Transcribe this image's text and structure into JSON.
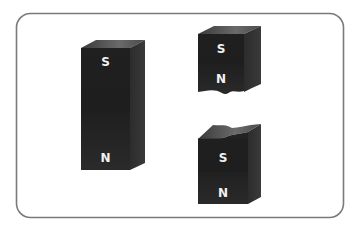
{
  "diagram": {
    "type": "bar-magnets",
    "colors": {
      "frame": "#7a7a7a",
      "background": "#ffffff",
      "magnet_front": "#262626",
      "magnet_side": "#333333",
      "magnet_top": "#5a5a5a",
      "label": "#f2f2f2"
    },
    "magnets": [
      {
        "id": "whole-magnet",
        "top_pole": "S",
        "bottom_pole": "N"
      },
      {
        "id": "upper-piece",
        "top_pole": "S",
        "bottom_pole": "N",
        "broken_edge": "bottom"
      },
      {
        "id": "lower-piece",
        "top_pole": "S",
        "bottom_pole": "N",
        "broken_edge": "top"
      }
    ]
  }
}
